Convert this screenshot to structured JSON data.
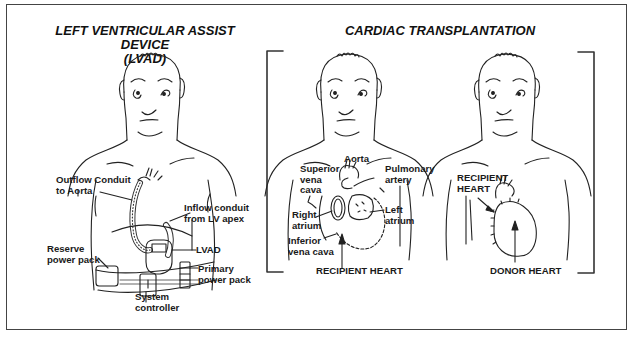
{
  "panels": {
    "lvad": {
      "title_line1": "LEFT VENTRICULAR ASSIST DEVICE",
      "title_line2": "(LVAD)",
      "labels": {
        "outflow": "Outflow Conduit\nto Aorta",
        "inflow": "Inflow conduit\nfrom LV apex",
        "lvad": "LVAD",
        "reserve": "Reserve\npower pack",
        "primary": "Primary\npower pack",
        "controller": "System\ncontroller"
      }
    },
    "transplant": {
      "title": "CARDIAC TRANSPLANTATION",
      "recipient": {
        "caption": "RECIPIENT HEART",
        "labels": {
          "aorta": "Aorta",
          "svc": "Superior\nvena\ncava",
          "pa": "Pulmonary\nartery",
          "ra": "Right\natrium",
          "la": "Left\natrium",
          "ivc": "Inferior\nvena cava"
        }
      },
      "donor": {
        "caption": "DONOR HEART",
        "labels": {
          "recipient_heart": "RECIPIENT\nHEART"
        }
      }
    }
  },
  "colors": {
    "line": "#222222",
    "frame": "#444444",
    "background": "#ffffff"
  }
}
